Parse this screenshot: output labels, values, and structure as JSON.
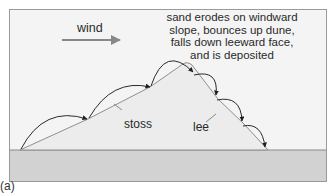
{
  "figure": {
    "panel_tag": "(a)",
    "wind_label": "wind",
    "description_lines": [
      "sand erodes on windward",
      "slope, bounces up dune,",
      "falls down leeward face,",
      "and is deposited"
    ],
    "stoss_label": "stoss",
    "lee_label": "lee"
  },
  "colors": {
    "panel_background": "#f4f4f4",
    "ground": "#d2d2d2",
    "dune_fill": "#ececec",
    "dune_outline": "#8a8a8a",
    "arrow": "#2a2a2a",
    "wind_arrow": "#888888"
  }
}
